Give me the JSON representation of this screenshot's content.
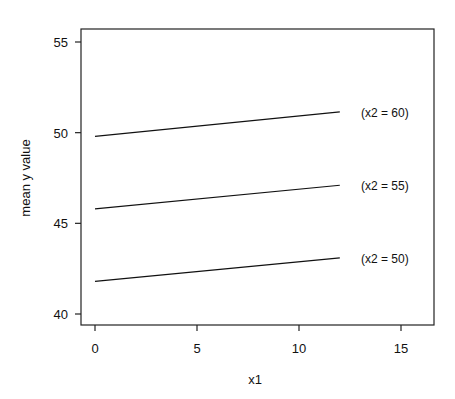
{
  "chart_data": {
    "type": "line",
    "title": "",
    "xlabel": "x1",
    "ylabel": "mean y value",
    "xlim": [
      -0.5,
      16.5
    ],
    "ylim": [
      39.5,
      55.5
    ],
    "xticks": [
      0,
      5,
      10,
      15
    ],
    "yticks": [
      40,
      45,
      50,
      55
    ],
    "grid": false,
    "legend": "none (inline labels at line ends)",
    "series": [
      {
        "name": "(x2 = 60)",
        "x": [
          0,
          12
        ],
        "y": [
          49.8,
          51.15
        ]
      },
      {
        "name": "(x2 = 55)",
        "x": [
          0,
          12
        ],
        "y": [
          45.8,
          47.1
        ]
      },
      {
        "name": "(x2 = 50)",
        "x": [
          0,
          12
        ],
        "y": [
          41.8,
          43.1
        ]
      }
    ]
  }
}
